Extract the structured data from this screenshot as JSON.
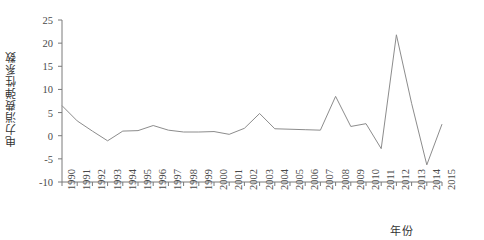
{
  "chart_data": {
    "type": "line",
    "title": "",
    "subtitle": "",
    "xlabel": "年份",
    "ylabel": "电力消费弹性系数",
    "xlim": [
      1990,
      2015
    ],
    "ylim": [
      -10,
      25
    ],
    "ytick_labels": [
      "25",
      "20",
      "15",
      "10",
      "5",
      "0",
      "-5",
      "-10"
    ],
    "ytick_values": [
      25,
      20,
      15,
      10,
      5,
      0,
      -5,
      -10
    ],
    "grid": false,
    "legend": null,
    "legend_position": "none",
    "line_color": "#8c8c8c",
    "axis_color": "#7a7a7a",
    "categories": [
      "1990",
      "1991",
      "1992",
      "1993",
      "1994",
      "1995",
      "1996",
      "1997",
      "1998",
      "1999",
      "2000",
      "2001",
      "2002",
      "2003",
      "2004",
      "2005",
      "2006",
      "2007",
      "2008",
      "2009",
      "2010",
      "2011",
      "2012",
      "2013",
      "2014",
      "2015"
    ],
    "x": [
      1990,
      1991,
      1992,
      1993,
      1994,
      1995,
      1996,
      1997,
      1998,
      1999,
      2000,
      2001,
      2002,
      2003,
      2004,
      2005,
      2006,
      2007,
      2008,
      2009,
      2010,
      2011,
      2012,
      2013,
      2014,
      2015
    ],
    "values": [
      6.5,
      3.2,
      1.0,
      -1.1,
      1.0,
      1.1,
      2.2,
      1.2,
      0.8,
      0.8,
      0.9,
      0.3,
      1.6,
      4.8,
      1.5,
      1.4,
      1.3,
      1.2,
      8.5,
      2.0,
      2.6,
      -2.8,
      21.8,
      7.0,
      -6.3,
      2.5
    ]
  },
  "axis": {
    "y_title": "电力消费弹性系数",
    "x_title": "年份"
  }
}
